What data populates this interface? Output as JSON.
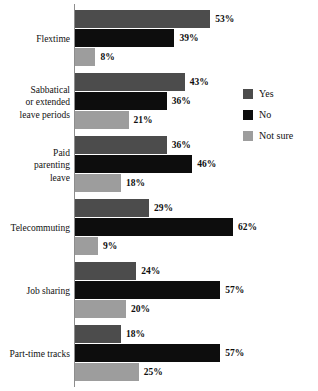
{
  "chart_data": {
    "type": "bar",
    "orientation": "horizontal",
    "title": "",
    "xlabel": "",
    "ylabel": "",
    "xlim": [
      0,
      65
    ],
    "grid": false,
    "legend_position": "right",
    "value_suffix": "%",
    "categories": [
      "Flextime",
      "Sabbatical or extended leave periods",
      "Paid parenting leave",
      "Telecommuting",
      "Job sharing",
      "Part-time tracks"
    ],
    "category_lines": [
      [
        "Flextime"
      ],
      [
        "Sabbatical",
        "or extended",
        "leave periods"
      ],
      [
        "Paid",
        "parenting",
        "leave"
      ],
      [
        "Telecommuting"
      ],
      [
        "Job sharing"
      ],
      [
        "Part-time tracks"
      ]
    ],
    "series": [
      {
        "name": "Yes",
        "color": "#4c4c4c",
        "values": [
          53,
          43,
          36,
          29,
          24,
          18
        ]
      },
      {
        "name": "No",
        "color": "#0d0d0d",
        "values": [
          39,
          36,
          46,
          62,
          57,
          57
        ]
      },
      {
        "name": "Not sure",
        "color": "#9d9d9d",
        "values": [
          8,
          21,
          18,
          9,
          20,
          25
        ]
      }
    ],
    "data_labels": [
      [
        "53%",
        "39%",
        "8%"
      ],
      [
        "43%",
        "36%",
        "21%"
      ],
      [
        "36%",
        "46%",
        "18%"
      ],
      [
        "29%",
        "62%",
        "9%"
      ],
      [
        "24%",
        "57%",
        "20%"
      ],
      [
        "18%",
        "57%",
        "25%"
      ]
    ]
  },
  "legend": {
    "items": [
      {
        "label": "Yes",
        "color": "#4c4c4c"
      },
      {
        "label": "No",
        "color": "#0d0d0d"
      },
      {
        "label": "Not sure",
        "color": "#9d9d9d"
      }
    ]
  },
  "axis": {
    "line_color": "#8d8d8d"
  },
  "scale": {
    "px_per_percent": 2.55
  }
}
